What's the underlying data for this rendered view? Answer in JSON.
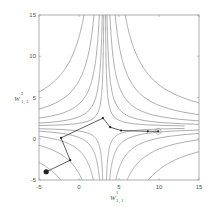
{
  "chart_data": {
    "type": "line",
    "subtype": "contour-with-trajectory",
    "title": "",
    "xlabel": "w^1_{1,1}",
    "ylabel": "w^2_{1,1}",
    "xlim": [
      -5,
      15
    ],
    "ylim": [
      -5,
      15
    ],
    "x_ticks": [
      "-5",
      "0",
      "5",
      "10",
      "15"
    ],
    "y_ticks": [
      "-5",
      "0",
      "5",
      "10",
      "15"
    ],
    "grid": false,
    "legend": null,
    "series": [
      {
        "name": "trajectory",
        "x": [
          -4.1,
          -1.1,
          -2.25,
          3.0,
          3.9,
          5.25,
          8.6,
          9.9
        ],
        "y": [
          -4.0,
          -2.6,
          0.1,
          2.5,
          1.4,
          1.0,
          0.9,
          0.9
        ],
        "start_marker": "filled-circle-large",
        "end_marker": "open-circle"
      }
    ],
    "contours": "hyperbolic saddle-shaped level curves; vertical branches near x≈-3..2 for y>2, horizontal branches near y≈0..3 for x>5"
  },
  "axes": {
    "x_label_main": "W",
    "x_label_sup": "1",
    "x_label_sub": "1, 1",
    "y_label_main": "W",
    "y_label_sup": "2",
    "y_label_sub": "1, 1"
  },
  "colors": {
    "contour": "#8a8a8a",
    "trajectory": "#333333",
    "axis": "#999999"
  }
}
